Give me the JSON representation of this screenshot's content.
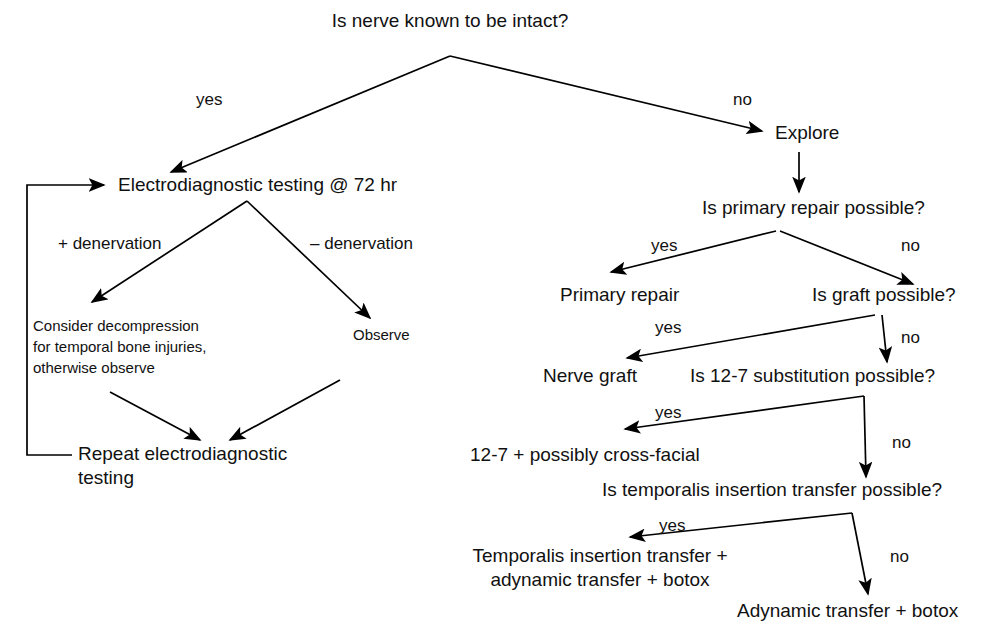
{
  "diagram": {
    "title": "Is nerve known to be intact?",
    "type": "flowchart",
    "orientation": "top-down",
    "colors": {
      "background": "#ffffff",
      "text": "#111111",
      "connector": "#000000"
    },
    "nodes": [
      {
        "id": "root",
        "label": "Is nerve known to be intact?",
        "kind": "decision",
        "lines": [
          "Is nerve known to be intact?"
        ],
        "x": 450,
        "y": 27,
        "anchor": "middle",
        "size": "normal"
      },
      {
        "id": "electrodiagnostic",
        "label": "Electrodiagnostic testing @ 72 hr",
        "kind": "process",
        "lines": [
          "Electrodiagnostic testing @ 72 hr"
        ],
        "x": 118,
        "y": 191,
        "anchor": "start",
        "size": "normal"
      },
      {
        "id": "consider-decompression",
        "label": "Consider decompression for temporal bone injuries, otherwise observe",
        "kind": "process",
        "lines": [
          "Consider decompression",
          "for temporal bone injuries,",
          "otherwise observe"
        ],
        "x": 33,
        "y": 331,
        "anchor": "start",
        "size": "small"
      },
      {
        "id": "observe",
        "label": "Observe",
        "kind": "process",
        "lines": [
          "Observe"
        ],
        "x": 353,
        "y": 340,
        "anchor": "start",
        "size": "small"
      },
      {
        "id": "repeat-testing",
        "label": "Repeat electrodiagnostic testing",
        "kind": "process",
        "lines": [
          "Repeat electrodiagnostic",
          "testing"
        ],
        "x": 78,
        "y": 460,
        "anchor": "start",
        "size": "normal"
      },
      {
        "id": "explore",
        "label": "Explore",
        "kind": "process",
        "lines": [
          "Explore"
        ],
        "x": 775,
        "y": 139,
        "anchor": "start",
        "size": "normal"
      },
      {
        "id": "primary-repair-q",
        "label": "Is primary repair possible?",
        "kind": "decision",
        "lines": [
          "Is primary repair possible?"
        ],
        "x": 702,
        "y": 214,
        "anchor": "start",
        "size": "normal"
      },
      {
        "id": "primary-repair",
        "label": "Primary repair",
        "kind": "process",
        "lines": [
          "Primary repair"
        ],
        "x": 560,
        "y": 301,
        "anchor": "start",
        "size": "normal"
      },
      {
        "id": "graft-q",
        "label": "Is graft possible?",
        "kind": "decision",
        "lines": [
          "Is graft possible?"
        ],
        "x": 812,
        "y": 301,
        "anchor": "start",
        "size": "normal"
      },
      {
        "id": "nerve-graft",
        "label": "Nerve graft",
        "kind": "process",
        "lines": [
          "Nerve graft"
        ],
        "x": 543,
        "y": 382,
        "anchor": "start",
        "size": "normal"
      },
      {
        "id": "substitution-q",
        "label": "Is 12-7 substitution possible?",
        "kind": "decision",
        "lines": [
          "Is 12-7 substitution possible?"
        ],
        "x": 690,
        "y": 382,
        "anchor": "start",
        "size": "normal"
      },
      {
        "id": "cross-facial",
        "label": "12-7 + possibly cross-facial",
        "kind": "process",
        "lines": [
          "12-7 + possibly cross-facial"
        ],
        "x": 470,
        "y": 461,
        "anchor": "start",
        "size": "normal"
      },
      {
        "id": "temporalis-q",
        "label": "Is temporalis insertion transfer possible?",
        "kind": "decision",
        "lines": [
          "Is temporalis insertion transfer possible?"
        ],
        "x": 602,
        "y": 496,
        "anchor": "start",
        "size": "normal"
      },
      {
        "id": "temporalis-transfer",
        "label": "Temporalis insertion transfer + adynamic transfer + botox",
        "kind": "process",
        "lines": [
          "Temporalis insertion transfer +",
          "adynamic transfer + botox"
        ],
        "x": 600,
        "y": 562,
        "anchor": "middle",
        "size": "normal"
      },
      {
        "id": "adynamic-transfer",
        "label": "Adynamic transfer + botox",
        "kind": "process",
        "lines": [
          "Adynamic transfer + botox"
        ],
        "x": 737,
        "y": 617,
        "anchor": "start",
        "size": "normal"
      }
    ],
    "edges": [
      {
        "id": "root-yes",
        "from": "root",
        "to": "electrodiagnostic",
        "label": "yes",
        "label_x": 196,
        "label_y": 105,
        "path": "M 450 56 L 171 172",
        "arrow": true
      },
      {
        "id": "root-no",
        "from": "root",
        "to": "explore",
        "label": "no",
        "label_x": 733,
        "label_y": 105,
        "path": "M 450 56 L 762 131",
        "arrow": true
      },
      {
        "id": "explore-to-primary-q",
        "from": "explore",
        "to": "primary-repair-q",
        "label": "",
        "label_x": 0,
        "label_y": 0,
        "path": "M 799 152 L 799 192",
        "arrow": true
      },
      {
        "id": "edt-plus",
        "from": "electrodiagnostic",
        "to": "consider-decompression",
        "label": "+ denervation",
        "label_x": 58,
        "label_y": 249,
        "path": "M 247 201 L 92 302",
        "arrow": true
      },
      {
        "id": "edt-minus",
        "from": "electrodiagnostic",
        "to": "observe",
        "label": "– denervation",
        "label_x": 310,
        "label_y": 249,
        "path": "M 247 201 L 370 318",
        "arrow": true
      },
      {
        "id": "decompression-to-repeat",
        "from": "consider-decompression",
        "to": "repeat-testing",
        "label": "",
        "label_x": 0,
        "label_y": 0,
        "path": "M 110 392 L 200 440",
        "arrow": true
      },
      {
        "id": "observe-to-repeat",
        "from": "observe",
        "to": "repeat-testing",
        "label": "",
        "label_x": 0,
        "label_y": 0,
        "path": "M 340 380 L 230 440",
        "arrow": true
      },
      {
        "id": "repeat-loopback",
        "from": "repeat-testing",
        "to": "electrodiagnostic",
        "label": "",
        "label_x": 0,
        "label_y": 0,
        "path": "M 72 455 L 27 455 L 27 185 L 104 185",
        "arrow": true
      },
      {
        "id": "primary-yes",
        "from": "primary-repair-q",
        "to": "primary-repair",
        "label": "yes",
        "label_x": 651,
        "label_y": 251,
        "path": "M 776 231 L 611 272",
        "arrow": true
      },
      {
        "id": "primary-no",
        "from": "primary-repair-q",
        "to": "graft-q",
        "label": "no",
        "label_x": 901,
        "label_y": 251,
        "path": "M 780 231 L 913 284",
        "arrow": true
      },
      {
        "id": "graft-yes",
        "from": "graft-q",
        "to": "nerve-graft",
        "label": "yes",
        "label_x": 655,
        "label_y": 333,
        "path": "M 875 315 L 627 358",
        "arrow": true
      },
      {
        "id": "graft-no",
        "from": "graft-q",
        "to": "substitution-q",
        "label": "no",
        "label_x": 901,
        "label_y": 343,
        "path": "M 882 315 L 887 362",
        "arrow": true
      },
      {
        "id": "substitution-yes",
        "from": "substitution-q",
        "to": "cross-facial",
        "label": "yes",
        "label_x": 655,
        "label_y": 418,
        "path": "M 864 396 L 625 429",
        "arrow": true
      },
      {
        "id": "substitution-no",
        "from": "substitution-q",
        "to": "temporalis-q",
        "label": "no",
        "label_x": 892,
        "label_y": 448,
        "path": "M 864 396 L 866 477",
        "arrow": true
      },
      {
        "id": "temporalis-yes",
        "from": "temporalis-q",
        "to": "temporalis-transfer",
        "label": "yes",
        "label_x": 659,
        "label_y": 531,
        "path": "M 852 513 L 630 537",
        "arrow": true
      },
      {
        "id": "temporalis-no",
        "from": "temporalis-q",
        "to": "adynamic-transfer",
        "label": "no",
        "label_x": 890,
        "label_y": 562,
        "path": "M 852 513 L 868 594",
        "arrow": true
      }
    ]
  }
}
